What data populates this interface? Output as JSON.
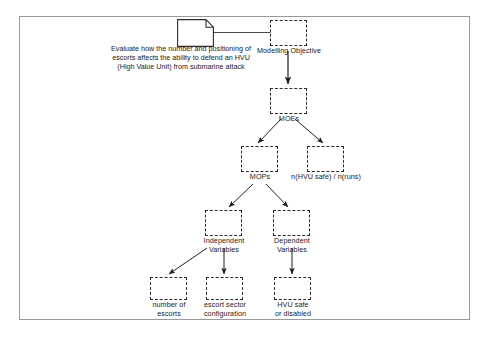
{
  "diagram": {
    "type": "hierarchy-flow-diagram",
    "frame": {
      "border_color": "#9a9a9a",
      "background": "#ffffff"
    },
    "box_style": {
      "stroke": "#2b2b2b",
      "dash": "dashed",
      "fill": "none"
    },
    "source_document": {
      "shape": "document-with-folded-corner",
      "text": "Evaluate how the number and positioning of escorts affects the ability to defend an HVU (High Value Unit) from submarine attack"
    },
    "nodes": [
      {
        "id": "modelling-objective",
        "label": "Modelling Objective"
      },
      {
        "id": "moes",
        "label": "MOEs"
      },
      {
        "id": "mops",
        "label": "MOPs"
      },
      {
        "id": "n-hvu-safe",
        "label": "n(HVU safe) / n(runs)"
      },
      {
        "id": "independent-variables",
        "label": "Independent\nVariables"
      },
      {
        "id": "dependent-variables",
        "label": "Dependent\nVariables"
      },
      {
        "id": "number-of-escorts",
        "label": "number of\nescorts"
      },
      {
        "id": "escort-sector-configuration",
        "label": "escort sector\nconfiguration"
      },
      {
        "id": "hvu-safe-or-disabled",
        "label": "HVU safe\nor disabled"
      }
    ],
    "edges": [
      {
        "from": "source-document",
        "to": "modelling-objective",
        "arrow": false
      },
      {
        "from": "modelling-objective",
        "to": "moes",
        "arrow": true
      },
      {
        "from": "moes",
        "to": "mops",
        "arrow": true
      },
      {
        "from": "moes",
        "to": "n-hvu-safe",
        "arrow": true
      },
      {
        "from": "mops",
        "to": "independent-variables",
        "arrow": true
      },
      {
        "from": "mops",
        "to": "dependent-variables",
        "arrow": true
      },
      {
        "from": "independent-variables",
        "to": "number-of-escorts",
        "arrow": true
      },
      {
        "from": "independent-variables",
        "to": "escort-sector-configuration",
        "arrow": true
      },
      {
        "from": "dependent-variables",
        "to": "hvu-safe-or-disabled",
        "arrow": true
      }
    ]
  }
}
